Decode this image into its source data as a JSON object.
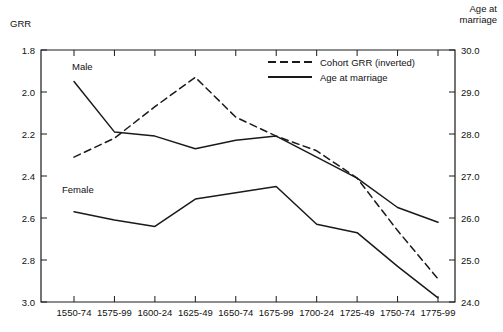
{
  "chart_data": {
    "type": "line",
    "title": "",
    "subtitle": "",
    "categories": [
      "1550-74",
      "1575-99",
      "1600-24",
      "1625-49",
      "1650-74",
      "1675-99",
      "1700-24",
      "1725-49",
      "1750-74",
      "1775-99"
    ],
    "left_axis": {
      "label": "GRR",
      "ticks": [
        "1.8",
        "2.0",
        "2.2",
        "2.4",
        "2.6",
        "2.8",
        "3.0"
      ],
      "ylim": [
        1.8,
        3.0
      ],
      "inverted": true,
      "note": "GRR axis runs 1.8 at top to 3.0 at bottom (inverted)"
    },
    "right_axis": {
      "label": "Age at\nmarriage",
      "label_line1": "Age at",
      "label_line2": "marriage",
      "ticks": [
        "30.0",
        "29.0",
        "28.0",
        "27.0",
        "26.0",
        "25.0",
        "24.0"
      ],
      "ylim": [
        24.0,
        30.0
      ],
      "inverted": true,
      "note": "Age axis runs 30.0 at top to 24.0 at bottom"
    },
    "xlabel": "",
    "grid": false,
    "legend_position": "top-center-right",
    "legend": [
      {
        "name": "Cohort GRR (inverted)",
        "style": "dashed",
        "axis": "left"
      },
      {
        "name": "Age at marriage",
        "style": "solid",
        "axis": "right"
      }
    ],
    "annotations": [
      {
        "text": "Male",
        "series": "age_at_marriage_male",
        "x_px": 72,
        "y_px": 70
      },
      {
        "text": "Female",
        "series": "age_at_marriage_female",
        "x_px": 62,
        "y_px": 193
      }
    ],
    "series": [
      {
        "name": "Cohort GRR (inverted)",
        "style": "dashed",
        "axis": "left",
        "unit": "GRR",
        "x_categories": [
          "1550-74",
          "1575-99",
          "1600-24",
          "1625-49",
          "1650-74",
          "1675-99",
          "1700-24",
          "1725-49",
          "1750-74",
          "1775-99"
        ],
        "values": [
          2.31,
          2.22,
          2.07,
          1.93,
          2.12,
          2.21,
          2.28,
          2.41,
          2.66,
          2.89
        ]
      },
      {
        "name": "Age at marriage - Male",
        "style": "solid",
        "axis": "right",
        "unit": "years",
        "x_categories": [
          "1550-74",
          "1575-99",
          "1600-24",
          "1625-49",
          "1650-74",
          "1675-99",
          "1700-24",
          "1725-49",
          "1750-74",
          "1775-99"
        ],
        "values": [
          29.25,
          28.05,
          27.95,
          27.65,
          27.85,
          27.95,
          27.45,
          26.95,
          26.25,
          25.9
        ]
      },
      {
        "name": "Age at marriage - Female",
        "style": "solid",
        "axis": "right",
        "unit": "years",
        "x_categories": [
          "1550-74",
          "1575-99",
          "1600-24",
          "1625-49",
          "1650-74",
          "1675-99",
          "1700-24",
          "1725-49",
          "1750-74",
          "1775-99"
        ],
        "values": [
          26.15,
          25.95,
          25.8,
          26.45,
          26.6,
          26.75,
          25.85,
          25.65,
          24.85,
          24.1
        ]
      }
    ]
  },
  "figure": {
    "background": "#ffffff",
    "line_color": "#1a1a1a",
    "frame_color": "#1a1a1a"
  }
}
